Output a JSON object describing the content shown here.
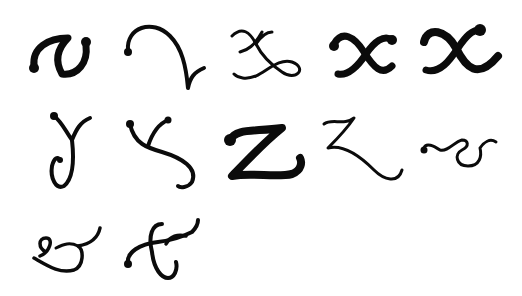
{
  "title": "Calligraphic letterform specimens",
  "ink_color": "#0b0b0b",
  "background_color": "#ffffff",
  "rows": [
    {
      "row": 1,
      "glyphs": [
        "v (bold swash)",
        "v (flourished)",
        "x (looped)",
        "x (bold)",
        "x (bold swash)"
      ]
    },
    {
      "row": 2,
      "glyphs": [
        "y (looped descender)",
        "y (swash)",
        "z (bold)",
        "z (flourished)",
        "& (small)"
      ]
    },
    {
      "row": 3,
      "glyphs": [
        "& (flourished)",
        "& (crossed)"
      ]
    }
  ],
  "glyph_count": 12
}
